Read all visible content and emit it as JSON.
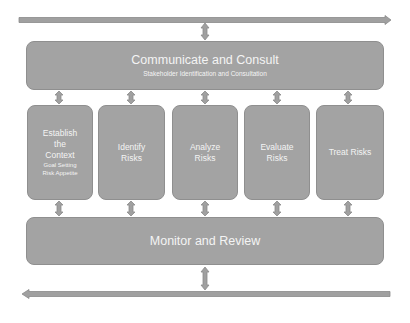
{
  "diagram": {
    "top_band": {
      "title": "Communicate and Consult",
      "subtitle": "Stakeholder Identification and Consultation"
    },
    "steps": [
      {
        "title_lines": [
          "Establish",
          "the",
          "Context"
        ],
        "sub_lines": [
          "Goal Setting",
          "Risk Appetite"
        ]
      },
      {
        "title_lines": [
          "Identify",
          "Risks"
        ],
        "sub_lines": []
      },
      {
        "title_lines": [
          "Analyze",
          "Risks"
        ],
        "sub_lines": []
      },
      {
        "title_lines": [
          "Evaluate",
          "Risks"
        ],
        "sub_lines": []
      },
      {
        "title_lines": [
          "Treat Risks"
        ],
        "sub_lines": []
      }
    ],
    "bottom_band": {
      "title": "Monitor and Review"
    },
    "arrows": {
      "top": "right-arrow",
      "bottom": "left-arrow",
      "connectors": "double-vertical-arrow"
    },
    "colors": {
      "box_fill": "#a3a3a3",
      "box_border": "#8f8f8f",
      "text": "#f4f4f4",
      "arrow_fill": "#a0a0a0",
      "arrow_border": "#8a8a8a"
    }
  }
}
